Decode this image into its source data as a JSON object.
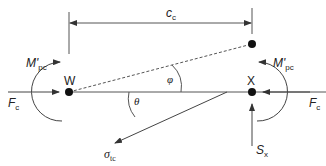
{
  "diagram": {
    "type": "free-body force diagram",
    "colors": {
      "stroke": "#333333",
      "text": "#222222",
      "background": "#ffffff"
    },
    "points": {
      "W": {
        "label": "W"
      },
      "X": {
        "label": "X"
      }
    },
    "dimension": {
      "label_main": "c",
      "label_sub": "c"
    },
    "forces": {
      "axial_left": {
        "label_main": "F",
        "label_sub": "c"
      },
      "axial_right": {
        "label_main": "F",
        "label_sub": "c"
      },
      "moment_left": {
        "label_main": "M'",
        "label_sub": "pc"
      },
      "moment_right": {
        "label_main": "M'",
        "label_sub": "pc"
      },
      "shear": {
        "label_main": "S",
        "label_sub": "x"
      },
      "tension": {
        "label_main": "σ",
        "label_sub": "tc"
      }
    },
    "angles": {
      "phi": {
        "label": "φ"
      },
      "theta": {
        "label": "θ"
      }
    }
  }
}
